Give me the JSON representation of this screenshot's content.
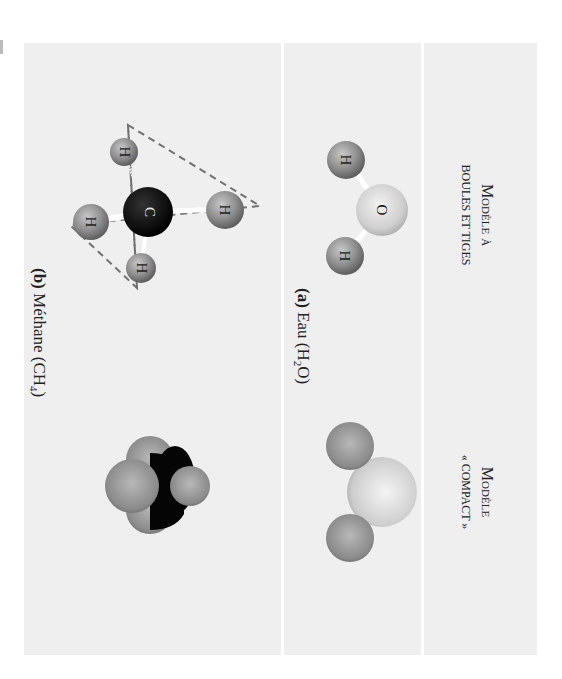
{
  "figure": {
    "orientation": "rotated 90 degrees clockwise",
    "columns": {
      "ball_and_stick": {
        "title_line1": "Modèle à",
        "title_line2": "boules et tiges"
      },
      "space_filling": {
        "title_line1": "Modèle",
        "title_line2": "« compact »"
      }
    },
    "rows": [
      {
        "id": "a",
        "label_prefix": "(a)",
        "label_name": "Eau (H",
        "label_sub": "2",
        "label_suffix": "O)",
        "atoms": [
          "O",
          "H",
          "H"
        ]
      },
      {
        "id": "b",
        "label_prefix": "(b)",
        "label_name": "Méthane (CH",
        "label_sub": "4",
        "label_suffix": ")",
        "atoms": [
          "C",
          "H",
          "H",
          "H",
          "H"
        ]
      }
    ],
    "colors": {
      "panel_background": "#efefef",
      "divider": "#ffffff",
      "hydrogen": "#8f8f8f",
      "oxygen": "#d4d4d4",
      "carbon": "#0a0a0a",
      "tetrahedron_dash": "#707070"
    }
  }
}
